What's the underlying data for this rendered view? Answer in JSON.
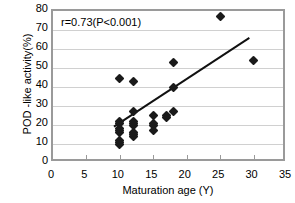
{
  "chart_data": {
    "type": "scatter",
    "title": "",
    "xlabel": "Maturation age (Y)",
    "ylabel": "POD -like activity(%)",
    "xlim": [
      0,
      35
    ],
    "ylim": [
      0,
      80
    ],
    "xticks": [
      0,
      5,
      10,
      15,
      20,
      25,
      30,
      35
    ],
    "yticks": [
      0,
      10,
      20,
      30,
      40,
      50,
      60,
      70,
      80
    ],
    "grid": "horizontal",
    "legend": "none",
    "annotation": "r=0.73(P<0.001)",
    "correlation_r": 0.73,
    "p_value": "<0.001",
    "marker": "diamond",
    "marker_color": "#1a1a1a",
    "points": [
      {
        "x": 10,
        "y": 10
      },
      {
        "x": 10,
        "y": 11
      },
      {
        "x": 10,
        "y": 12
      },
      {
        "x": 10,
        "y": 16
      },
      {
        "x": 10,
        "y": 17
      },
      {
        "x": 10,
        "y": 18
      },
      {
        "x": 10,
        "y": 21
      },
      {
        "x": 10,
        "y": 22
      },
      {
        "x": 10,
        "y": 44.5
      },
      {
        "x": 12,
        "y": 14
      },
      {
        "x": 12,
        "y": 15
      },
      {
        "x": 12,
        "y": 16
      },
      {
        "x": 12,
        "y": 20
      },
      {
        "x": 12,
        "y": 21
      },
      {
        "x": 12,
        "y": 22
      },
      {
        "x": 12,
        "y": 27
      },
      {
        "x": 12,
        "y": 43
      },
      {
        "x": 15,
        "y": 17
      },
      {
        "x": 15,
        "y": 20
      },
      {
        "x": 15,
        "y": 21
      },
      {
        "x": 15,
        "y": 25
      },
      {
        "x": 17,
        "y": 24
      },
      {
        "x": 17,
        "y": 25
      },
      {
        "x": 18,
        "y": 27
      },
      {
        "x": 18,
        "y": 40
      },
      {
        "x": 18,
        "y": 53
      },
      {
        "x": 25,
        "y": 77
      },
      {
        "x": 30,
        "y": 54
      }
    ],
    "trendline": {
      "x0": 9.2,
      "y0": 17.5,
      "x1": 30.0,
      "y1": 65.5,
      "color": "#111111",
      "width": 2
    }
  }
}
